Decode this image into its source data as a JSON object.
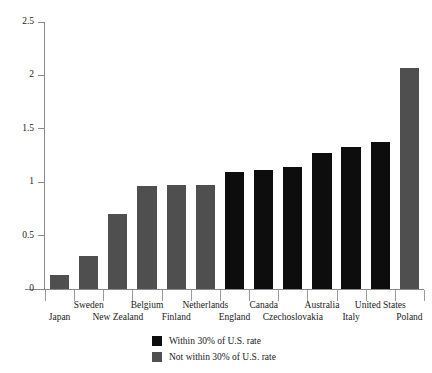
{
  "chart_data": {
    "type": "bar",
    "title": "",
    "subtitle": "",
    "xlabel": "",
    "ylabel": "",
    "ylim": [
      0,
      2.5
    ],
    "yticks": [
      "0",
      "0.5",
      "1",
      "1.5",
      "2",
      "2.5"
    ],
    "ytick_values": [
      0,
      0.5,
      1,
      1.5,
      2,
      2.5
    ],
    "grid": false,
    "legend_position": "bottom",
    "categories": [
      "Japan",
      "Sweden",
      "New Zealand",
      "Belgium",
      "Finland",
      "Netherlands",
      "England",
      "Canada",
      "Czechoslovakia",
      "Australia",
      "Italy",
      "United States",
      "Poland"
    ],
    "values": [
      0.13,
      0.31,
      0.7,
      0.96,
      0.97,
      0.97,
      1.1,
      1.11,
      1.14,
      1.27,
      1.33,
      1.38,
      2.07
    ],
    "groups": [
      "not-within",
      "not-within",
      "not-within",
      "not-within",
      "not-within",
      "not-within",
      "within",
      "within",
      "within",
      "within",
      "within",
      "within",
      "not-within"
    ],
    "legend": [
      {
        "key": "within",
        "label": "Within 30% of U.S. rate",
        "color": "#0d0d0d"
      },
      {
        "key": "not-within",
        "label": "Not within 30% of U.S. rate",
        "color": "#4f4f4f"
      }
    ],
    "colors": {
      "within": "#0d0d0d",
      "not_within": "#4f4f4f",
      "axis": "#8a8a8a",
      "text": "#1a1a1a",
      "background": "#ffffff"
    }
  }
}
